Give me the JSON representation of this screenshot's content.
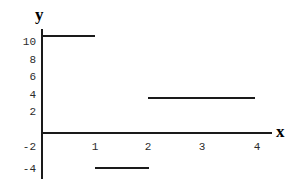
{
  "figure": {
    "width": 305,
    "height": 186,
    "background": "#ffffff",
    "line_color": "#1a1a1a",
    "text_color": "#2b2b2b"
  },
  "axes": {
    "y_axis_name": "y",
    "x_axis_name": "x",
    "y_tick_labels": [
      "10",
      "8",
      "6",
      "4",
      "2",
      "-2",
      "-4"
    ],
    "x_tick_labels": [
      "1",
      "2",
      "3",
      "4"
    ]
  },
  "chart_data": {
    "type": "line",
    "title": "",
    "subtitle": "",
    "xlabel": "x",
    "ylabel": "y",
    "xlim": [
      0,
      4.3
    ],
    "ylim": [
      -4,
      11
    ],
    "grid": false,
    "legend": null,
    "xticks": [
      1,
      2,
      3,
      4
    ],
    "xticklabels": [
      "1",
      "2",
      "3",
      "4"
    ],
    "yticks": [
      10,
      8,
      6,
      4,
      2,
      -2,
      -4
    ],
    "yticklabels": [
      "10",
      "8",
      "6",
      "4",
      "2",
      "-2",
      "-4"
    ],
    "series": [
      {
        "name": "step function",
        "style": "horizontal-segments",
        "segments": [
          {
            "x_start": 0,
            "x_end": 1,
            "y": 11
          },
          {
            "x_start": 1,
            "x_end": 2,
            "y": -4
          },
          {
            "x_start": 2,
            "x_end": 4,
            "y": 4
          }
        ]
      }
    ],
    "annotations": []
  }
}
